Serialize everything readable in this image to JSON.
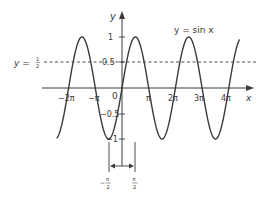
{
  "chart_data": {
    "type": "line",
    "title": "",
    "xlabel": "x",
    "ylabel": "y",
    "series": [
      {
        "name": "y = sin x",
        "function": "sin(x)",
        "x_range_pi": [
          -2.45,
          4.4
        ]
      }
    ],
    "x_ticks": [
      "−2π",
      "−π",
      "0",
      "π",
      "2π",
      "3π",
      "4π"
    ],
    "x_tick_values_pi": [
      -2,
      -1,
      0,
      1,
      2,
      3,
      4
    ],
    "y_ticks": [
      "1",
      "0.5",
      "−0.5",
      "−1"
    ],
    "y_tick_values": [
      1,
      0.5,
      -0.5,
      -1
    ],
    "ylim": [
      -1,
      1
    ],
    "grid": false,
    "annotations": [
      {
        "type": "hline",
        "y": 0.5,
        "style": "dashed",
        "label": "y = ½"
      },
      {
        "type": "curve-label",
        "text": "y = sin x"
      },
      {
        "type": "interval-marker",
        "from": "−π/2",
        "to": "π/2",
        "style": "double-arrow"
      }
    ]
  },
  "labels": {
    "y_axis": "y",
    "x_axis": "x",
    "curve": "y = sin x",
    "hline_prefix": "y = ",
    "hline_num": "1",
    "hline_den": "2",
    "origin": "0",
    "xt_m2pi": "−2π",
    "xt_mpi": "−π",
    "xt_pi": "π",
    "xt_2pi": "2π",
    "xt_3pi": "3π",
    "xt_4pi": "4π",
    "yt_1": "1",
    "yt_05": "0.5",
    "yt_m05": "−0.5",
    "yt_m1": "−1",
    "left_bound_sign": "−",
    "bound_num": "π",
    "bound_den": "2"
  },
  "colors": {
    "curve": "#3a3a3a",
    "axes": "#3a3a3a",
    "text": "#3a3a3a"
  }
}
